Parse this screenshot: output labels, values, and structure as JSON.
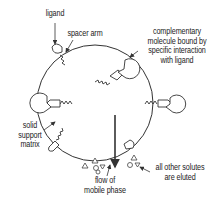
{
  "diagram": {
    "type": "affinity-chromatography-schematic",
    "colors": {
      "stroke": "#333333",
      "text": "#222222",
      "background": "#ffffff"
    },
    "labels": {
      "ligand": "ligand",
      "spacer_arm": "spacer arm",
      "complementary": [
        "complementary",
        "molecule bound by",
        "specific interaction",
        "with ligand"
      ],
      "support": [
        "solid",
        "support",
        "matrix"
      ],
      "flow": [
        "flow of",
        "mobile phase"
      ],
      "eluted": [
        "all other solutes",
        "are eluted"
      ]
    },
    "elements": {
      "matrix_bead": "large circle",
      "spacer_arms": "zigzag lines",
      "ligands": "cone shapes",
      "bound_molecules": "pac-man circles",
      "flow_arrow": "downward arrow",
      "solutes": "small triangles and circles"
    }
  }
}
